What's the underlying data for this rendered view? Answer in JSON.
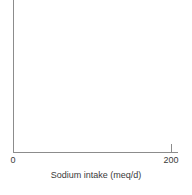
{
  "chart_data": {
    "type": "scatter",
    "title": "",
    "subtitle": "",
    "xlabel": "Sodium intake (meq/d)",
    "ylabel": "",
    "x": [],
    "values": [],
    "series": [],
    "annotations": [],
    "legend": [],
    "legend_position": "none",
    "grid": false,
    "xlim": [
      0,
      200
    ],
    "ylim": [
      0,
      1
    ],
    "x_ticks": [
      {
        "value": 0,
        "label": "0",
        "mark_drawn": false
      },
      {
        "value": 200,
        "label": "200",
        "mark_drawn": true
      }
    ],
    "y_ticks": []
  },
  "figure": {
    "axis_color": "#8c8c8c",
    "text_color": "#3a3a3a",
    "background_color": "#ffffff",
    "x_axis_title": "Sodium intake (meq/d)",
    "tick_label_min": "0",
    "tick_label_max": "200"
  }
}
